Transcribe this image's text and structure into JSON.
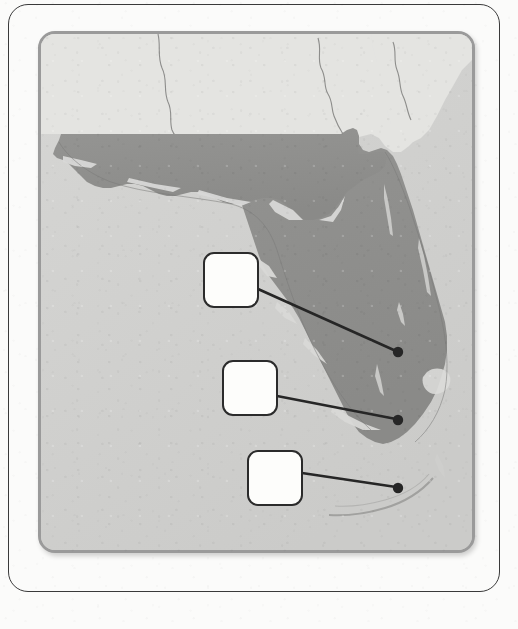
{
  "worksheet": {
    "type": "blank-label-map-worksheet",
    "frame_label": "worksheet-frame",
    "background_color": "#fbfbfa"
  },
  "map": {
    "name": "Florida",
    "region_label": "Florida peninsula and panhandle",
    "colors": {
      "highlight_state": "#8f8f8d",
      "neighbor_land": "#e2e2df",
      "water": "#d2d2d0",
      "panel_border": "#9a9a9a",
      "panel_background": "#d2d2d0",
      "boundary_line": "#7c7c7a"
    },
    "panel": {
      "left": 38,
      "top": 31,
      "width": 437,
      "height": 522,
      "border_radius": 17
    }
  },
  "callouts": [
    {
      "id": "callout-1",
      "label": "",
      "placeholder": "",
      "box": {
        "x": 203,
        "y": 252,
        "w": 56,
        "h": 56
      },
      "anchor": {
        "x": 398,
        "y": 352
      },
      "line_from": {
        "x": 258,
        "y": 289
      }
    },
    {
      "id": "callout-2",
      "label": "",
      "placeholder": "",
      "box": {
        "x": 222,
        "y": 360,
        "w": 56,
        "h": 56
      },
      "anchor": {
        "x": 398,
        "y": 420
      },
      "line_from": {
        "x": 277,
        "y": 396
      }
    },
    {
      "id": "callout-3",
      "label": "",
      "placeholder": "",
      "box": {
        "x": 247,
        "y": 450,
        "w": 56,
        "h": 56
      },
      "anchor": {
        "x": 398,
        "y": 488
      },
      "line_from": {
        "x": 302,
        "y": 473
      }
    }
  ],
  "markers": {
    "count": 3,
    "style": {
      "radius": 5,
      "color": "#262626"
    },
    "leader_line": {
      "color": "#262626",
      "width": 2.6
    }
  }
}
